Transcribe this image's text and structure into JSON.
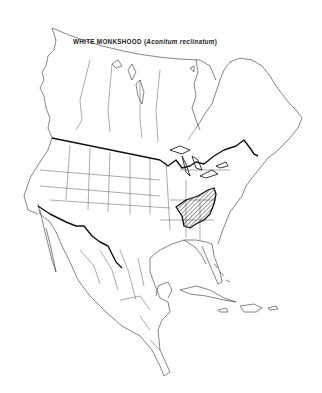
{
  "title": {
    "common_name": "WHITE MONKSHOOD (",
    "scientific_name": "Aconitum reclinatum",
    "close_paren": ")"
  },
  "map": {
    "region": "North America",
    "range_label": "Native range (hatched)",
    "colors": {
      "background": "#ffffff",
      "outline": "#222222",
      "international_border": "#111111",
      "range_hatch": "#333333"
    }
  }
}
